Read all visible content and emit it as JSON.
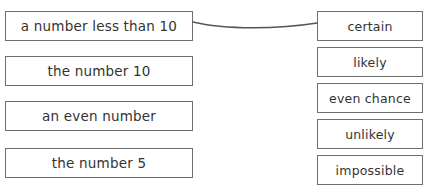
{
  "worksheet": {
    "title": "Probability matching activity",
    "background_color": "#ffffff",
    "border_color": "#6e6e6e",
    "text_color": "#333333",
    "connector_color": "#555555"
  },
  "left_column": {
    "name": "events-column",
    "items": [
      {
        "label": "a number less than 10",
        "x": 5,
        "y": 11,
        "width": 188,
        "height": 30,
        "connected": true
      },
      {
        "label": "the number 10",
        "x": 5,
        "y": 56,
        "width": 188,
        "height": 30,
        "connected": false
      },
      {
        "label": "an even number",
        "x": 5,
        "y": 101,
        "width": 188,
        "height": 30,
        "connected": false
      },
      {
        "label": "the number 5",
        "x": 5,
        "y": 148,
        "width": 188,
        "height": 30,
        "connected": false
      }
    ]
  },
  "right_column": {
    "name": "likelihood-column",
    "items": [
      {
        "label": "certain",
        "x": 317,
        "y": 11,
        "width": 106,
        "height": 30,
        "connected": true
      },
      {
        "label": "likely",
        "x": 317,
        "y": 47,
        "width": 106,
        "height": 30,
        "connected": false
      },
      {
        "label": "even chance",
        "x": 317,
        "y": 83,
        "width": 106,
        "height": 30,
        "connected": false
      },
      {
        "label": "unlikely",
        "x": 317,
        "y": 119,
        "width": 106,
        "height": 30,
        "connected": false
      },
      {
        "label": "impossible",
        "x": 317,
        "y": 155,
        "width": 106,
        "height": 30,
        "connected": false
      }
    ]
  },
  "connections": [
    {
      "name": "connector-less-than-10-to-certain",
      "from": "a number less than 10",
      "to": "certain",
      "path": "M 193 22 C 225 30, 280 29, 317 23"
    }
  ]
}
